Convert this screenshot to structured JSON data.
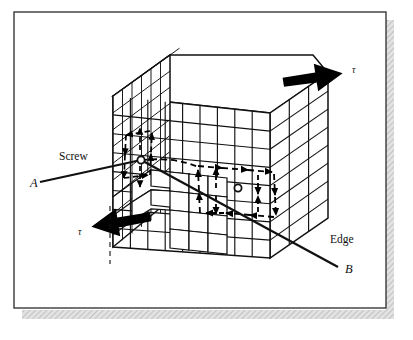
{
  "figure": {
    "name": "mixed-dislocation-diagram",
    "frame": {
      "border_color": "#1a1a1a",
      "fill_color": "#ffffff",
      "shadow_color": "#c9c9c9",
      "x": 14,
      "y": 12,
      "width": 372,
      "height": 296
    }
  },
  "labels": {
    "screw": "Screw",
    "edge": "Edge",
    "point_a": "A",
    "point_b": "B",
    "tau_top": "τ",
    "tau_bottom": "τ"
  },
  "colors": {
    "line": "#111111",
    "grid": "#111111",
    "arrow_fill": "#000000",
    "block_face": "#ffffff",
    "dashed": "#000000"
  },
  "block": {
    "top_face": [
      [
        113,
        96
      ],
      [
        170,
        55
      ],
      [
        313,
        55
      ],
      [
        313,
        55
      ],
      [
        328,
        73
      ],
      [
        270,
        113
      ]
    ],
    "left_face": [
      [
        113,
        96
      ],
      [
        170,
        55
      ],
      [
        170,
        200
      ],
      [
        113,
        247
      ]
    ],
    "front_face": [
      [
        113,
        96
      ],
      [
        270,
        113
      ],
      [
        270,
        258
      ],
      [
        113,
        247
      ]
    ],
    "right_face": [
      [
        270,
        113
      ],
      [
        328,
        73
      ],
      [
        328,
        218
      ],
      [
        270,
        258
      ]
    ],
    "left_grid_cols": 6,
    "left_grid_rows": 9,
    "front_grid_cols": 9,
    "front_grid_rows": 8,
    "right_grid_cols": 3,
    "right_grid_rows": 8
  },
  "dislocation_line": {
    "start": [
      40,
      182
    ],
    "screw_core": [
      141,
      160
    ],
    "edge_core": [
      238,
      188
    ],
    "end": [
      338,
      267
    ],
    "type": "mixed"
  },
  "stress_arrows": [
    {
      "name": "tau-top-right",
      "direction": "right",
      "x": 290,
      "y": 75,
      "label": "τ"
    },
    {
      "name": "tau-bottom-left",
      "direction": "left",
      "x": 95,
      "y": 232,
      "label": "τ"
    }
  ],
  "burgers_circuits": [
    {
      "name": "screw-circuit",
      "center": [
        138,
        158
      ],
      "plane": "left-face"
    },
    {
      "name": "edge-circuit",
      "center": [
        238,
        188
      ],
      "plane": "front-face"
    }
  ],
  "dashed_axis": {
    "x": 110,
    "y1": 206,
    "y2": 264
  }
}
